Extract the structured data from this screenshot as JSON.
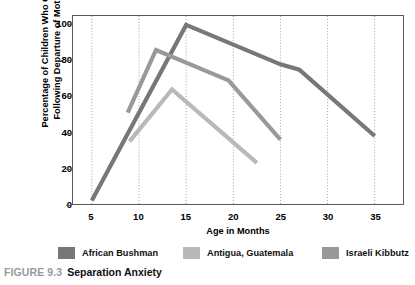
{
  "caption": {
    "figure_number": "FIGURE 9.3",
    "title": "Separation Anxiety"
  },
  "legend": [
    {
      "label": "African Bushman",
      "color": "#777777"
    },
    {
      "label": "Antigua, Guatemala",
      "color": "#b9b9b9"
    },
    {
      "label": "Israeli Kibbutz",
      "color": "#999999"
    }
  ],
  "chart_data": {
    "type": "line",
    "title": "",
    "subtitle": "",
    "xlabel": "Age in Months",
    "ylabel": "Percentage of Children Who Cried Following Departure of Mother",
    "ylabel_line1": "Percentage of Children Who Cried",
    "ylabel_line2": "Following Departure of Mother",
    "xlim": [
      3,
      38
    ],
    "ylim": [
      0,
      105
    ],
    "xticks": [
      5,
      10,
      15,
      20,
      25,
      30,
      35
    ],
    "yticks": [
      0,
      20,
      40,
      60,
      80,
      100
    ],
    "grid": "vertical-dotted",
    "legend_position": "bottom",
    "series": [
      {
        "name": "African Bushman",
        "color": "#777777",
        "points": [
          {
            "x": 5,
            "y": 2
          },
          {
            "x": 15,
            "y": 100
          },
          {
            "x": 25,
            "y": 78
          },
          {
            "x": 27,
            "y": 75
          },
          {
            "x": 35,
            "y": 38
          }
        ]
      },
      {
        "name": "Antigua, Guatemala",
        "color": "#b9b9b9",
        "points": [
          {
            "x": 9,
            "y": 35
          },
          {
            "x": 13.5,
            "y": 64
          },
          {
            "x": 22.5,
            "y": 23
          }
        ]
      },
      {
        "name": "Israeli Kibbutz",
        "color": "#999999",
        "points": [
          {
            "x": 8.8,
            "y": 51
          },
          {
            "x": 11.8,
            "y": 86
          },
          {
            "x": 19.5,
            "y": 69
          },
          {
            "x": 25,
            "y": 36
          }
        ]
      }
    ]
  }
}
